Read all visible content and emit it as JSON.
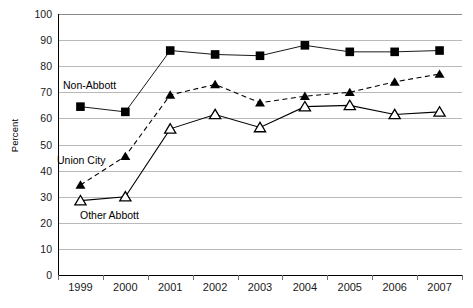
{
  "chart_data": {
    "type": "line",
    "title": "",
    "xlabel": "",
    "ylabel": "Percent",
    "ylim": [
      0,
      100
    ],
    "ytick_step": 10,
    "grid": true,
    "legend_position": "inline-annotations",
    "categories": [
      "1999",
      "2000",
      "2001",
      "2002",
      "2003",
      "2004",
      "2005",
      "2006",
      "2007"
    ],
    "yticks": [
      "0",
      "10",
      "20",
      "30",
      "40",
      "50",
      "60",
      "70",
      "80",
      "90",
      "100"
    ],
    "series": [
      {
        "name": "Non-Abbott",
        "marker": "filled-square",
        "line_style": "solid",
        "color": "#000000",
        "values": [
          64.5,
          62.5,
          86,
          84.5,
          84,
          88,
          85.5,
          85.5,
          86
        ]
      },
      {
        "name": "Union City",
        "marker": "filled-triangle",
        "line_style": "dashed",
        "color": "#000000",
        "values": [
          34.5,
          45.5,
          69,
          73,
          66,
          68.5,
          70,
          74,
          77
        ]
      },
      {
        "name": "Other Abbott",
        "marker": "open-triangle",
        "line_style": "solid",
        "color": "#000000",
        "values": [
          28.5,
          30,
          56,
          61.5,
          56.5,
          64.5,
          65,
          61.5,
          62.5
        ]
      }
    ],
    "annotations": [
      {
        "text": "Non-Abbott",
        "series": "Non-Abbott"
      },
      {
        "text": "Union City",
        "series": "Union City"
      },
      {
        "text": "Other Abbott",
        "series": "Other Abbott"
      }
    ]
  }
}
